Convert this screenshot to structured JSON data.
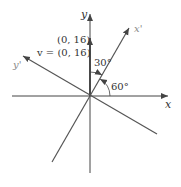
{
  "diagram": {
    "axes": {
      "x_label": "x",
      "y_label": "y",
      "x_prime_label": "x'",
      "y_prime_label": "y'"
    },
    "point_label": "(0, 16)",
    "vector_label": "v = (0, 16)",
    "angles": {
      "between_y_and_x_prime": "30°",
      "between_x_and_x_prime": "60°"
    },
    "colors": {
      "axis": "#444444",
      "rotated_axis": "#555555",
      "prime_label": "#888888"
    }
  }
}
